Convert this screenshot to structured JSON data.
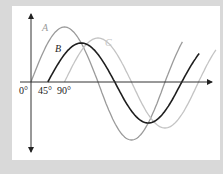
{
  "figure": {
    "background_color": "#d9d9d9",
    "panel_color": "#ffffff",
    "axis_color": "#222222",
    "curves": [
      {
        "label": "A",
        "phase_deg": 0,
        "color": "#9a9a9a",
        "amplitude_px_up": 55,
        "amplitude_px_down": 58
      },
      {
        "label": "B",
        "phase_deg": 45,
        "color": "#1e1e1e",
        "amplitude_px_up": 39,
        "amplitude_px_down": 41
      },
      {
        "label": "C",
        "phase_deg": 90,
        "color": "#c4c4c4",
        "amplitude_px_up": 44,
        "amplitude_px_down": 46
      }
    ],
    "tick_labels": [
      "0°",
      "45°",
      "90°"
    ]
  }
}
